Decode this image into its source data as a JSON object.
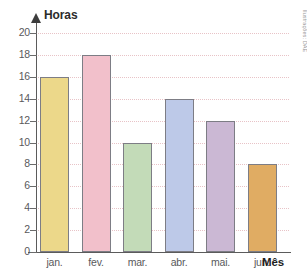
{
  "chart_data": {
    "type": "bar",
    "title": "",
    "xlabel": "Mês",
    "ylabel": "Horas",
    "categories": [
      "jan.",
      "fev.",
      "mar.",
      "abr.",
      "mai.",
      "jun."
    ],
    "values": [
      16,
      18,
      10,
      14,
      12,
      8
    ],
    "ylim": [
      0,
      20
    ],
    "y_ticks": [
      0,
      2,
      4,
      6,
      8,
      10,
      12,
      14,
      16,
      18,
      20
    ],
    "grid": true,
    "legend": "none",
    "bar_colors": [
      "#ecd88a",
      "#f2c0cb",
      "#c3dbb8",
      "#bdc9e8",
      "#cbb8d4",
      "#e0ac63"
    ],
    "bar_border_color": "#7d7d85",
    "gridline_color": "#e8c3c7",
    "axis_color": "#5b5b5b"
  },
  "credit": {
    "text": "Ilustrações: DAE"
  }
}
